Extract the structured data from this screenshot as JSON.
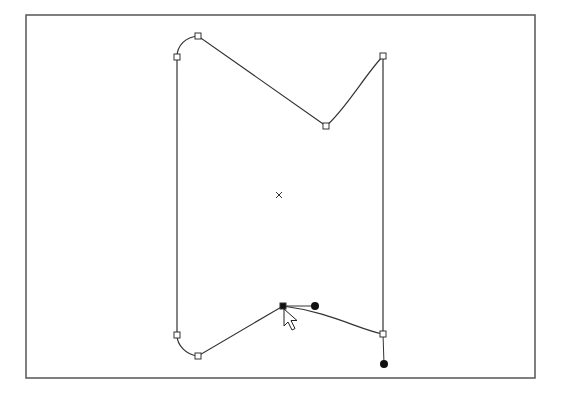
{
  "canvas": {
    "width": 563,
    "height": 396,
    "background": "#ffffff",
    "stroke_color": "#333333",
    "frame": {
      "x": 26,
      "y": 15,
      "width": 509,
      "height": 363
    }
  },
  "path": {
    "label": "Selected bezier path",
    "d": "M 177 57 C 177 45 186 37 198 36 L 326 126 C 345 110 365 75 383 56 L 383 334 C 360 330 330 312 283 306 L 198 356 C 186 355 177 345 177 335 Z",
    "anchor_points": [
      {
        "id": "top-left-side",
        "x": 177,
        "y": 57,
        "selected": false
      },
      {
        "id": "top-left-corner",
        "x": 198,
        "y": 36,
        "selected": false
      },
      {
        "id": "top-notch",
        "x": 326,
        "y": 126,
        "selected": false
      },
      {
        "id": "top-right",
        "x": 383,
        "y": 56,
        "selected": false
      },
      {
        "id": "bottom-right",
        "x": 383,
        "y": 334,
        "selected": false
      },
      {
        "id": "bottom-notch",
        "x": 283,
        "y": 306,
        "selected": true
      },
      {
        "id": "bottom-left-corner",
        "x": 198,
        "y": 356,
        "selected": false
      },
      {
        "id": "bottom-left-side",
        "x": 177,
        "y": 335,
        "selected": false
      }
    ],
    "control_handles": [
      {
        "id": "bottom-notch-handle",
        "from_x": 283,
        "from_y": 306,
        "x": 315,
        "y": 306
      },
      {
        "id": "bottom-right-handle",
        "from_x": 383,
        "from_y": 334,
        "x": 384,
        "y": 364
      }
    ],
    "center_marker": {
      "x": 279,
      "y": 195
    }
  },
  "cursor": {
    "type": "arrow-pointer",
    "x": 284,
    "y": 309
  }
}
